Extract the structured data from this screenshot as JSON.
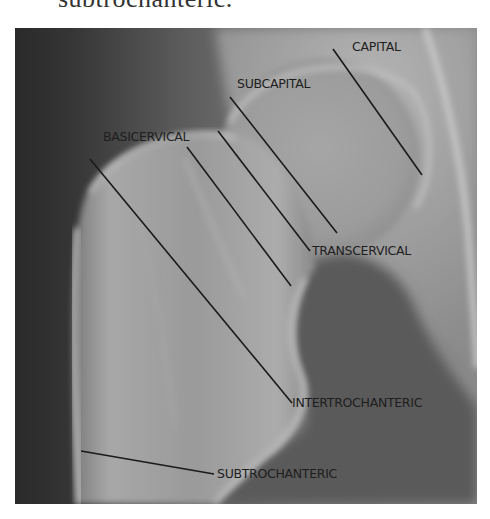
{
  "caption": {
    "text": "subtrochanteric."
  },
  "figure": {
    "colors": {
      "dark_soft_tissue": "#2e2e2e",
      "bone_light": "#b0b0b0",
      "mid_gray": "#6a6a6a",
      "annotation": "#1a1a1a"
    },
    "annotations": [
      {
        "label": "CAPITAL",
        "label_x": 352,
        "label_y": 40,
        "line": [
          333,
          49,
          422,
          175
        ]
      },
      {
        "label": "SUBCAPITAL",
        "label_x": 237,
        "label_y": 77,
        "line": [
          230,
          97,
          337,
          233
        ]
      },
      {
        "label": "BASICERVICAL",
        "label_x": 103,
        "label_y": 130,
        "line": [
          187,
          147,
          291,
          286
        ]
      },
      {
        "label": "TRANSCERVICAL",
        "label_x": 312,
        "label_y": 244,
        "line": [
          218,
          131,
          310,
          251
        ]
      },
      {
        "label": "INTERTROCHANTERIC",
        "label_x": 292,
        "label_y": 396,
        "line": [
          90,
          159,
          292,
          403
        ]
      },
      {
        "label": "SUBTROCHANTERIC",
        "label_x": 217,
        "label_y": 467,
        "line": [
          81,
          451,
          214,
          474
        ]
      }
    ]
  }
}
